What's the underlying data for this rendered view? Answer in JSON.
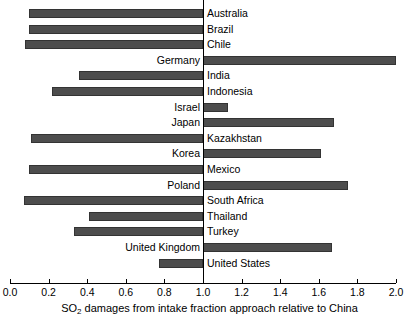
{
  "chart_data": {
    "type": "bar",
    "orientation": "horizontal",
    "title": "",
    "xlabel": "SO2 damages from intake fraction approach relative to China",
    "xlabel_parts": {
      "pre": "SO",
      "sub": "2",
      "post": " damages from intake fraction approach relative to China"
    },
    "ylabel": "",
    "xlim": [
      0.0,
      2.0
    ],
    "reference_value": 1.0,
    "grid": false,
    "legend": null,
    "tick_labels": [
      "0.0",
      "0.2",
      "0.4",
      "0.6",
      "0.8",
      "1.0",
      "1.2",
      "1.4",
      "1.6",
      "1.8",
      "2.0"
    ],
    "ticks": [
      0.0,
      0.2,
      0.4,
      0.6,
      0.8,
      1.0,
      1.2,
      1.4,
      1.6,
      1.8,
      2.0
    ],
    "bar_color": "#4d4d4d",
    "bar_edge_color": "#333333",
    "categories": [
      "Australia",
      "Brazil",
      "Chile",
      "Germany",
      "India",
      "Indonesia",
      "Israel",
      "Japan",
      "Kazakhstan",
      "Korea",
      "Mexico",
      "Poland",
      "South Africa",
      "Thailand",
      "Turkey",
      "United Kingdom",
      "United States"
    ],
    "values": [
      0.1,
      0.1,
      0.08,
      2.0,
      0.36,
      0.22,
      1.13,
      1.68,
      0.11,
      1.61,
      0.1,
      1.75,
      0.07,
      0.41,
      0.33,
      1.67,
      0.77
    ],
    "bars": [
      {
        "label": "Australia",
        "value": 0.1,
        "label_side": "right"
      },
      {
        "label": "Brazil",
        "value": 0.1,
        "label_side": "right"
      },
      {
        "label": "Chile",
        "value": 0.08,
        "label_side": "right"
      },
      {
        "label": "Germany",
        "value": 2.0,
        "label_side": "left"
      },
      {
        "label": "India",
        "value": 0.36,
        "label_side": "right"
      },
      {
        "label": "Indonesia",
        "value": 0.22,
        "label_side": "right"
      },
      {
        "label": "Israel",
        "value": 1.13,
        "label_side": "left"
      },
      {
        "label": "Japan",
        "value": 1.68,
        "label_side": "left"
      },
      {
        "label": "Kazakhstan",
        "value": 0.11,
        "label_side": "right"
      },
      {
        "label": "Korea",
        "value": 1.61,
        "label_side": "left"
      },
      {
        "label": "Mexico",
        "value": 0.1,
        "label_side": "right"
      },
      {
        "label": "Poland",
        "value": 1.75,
        "label_side": "left"
      },
      {
        "label": "South Africa",
        "value": 0.07,
        "label_side": "right"
      },
      {
        "label": "Thailand",
        "value": 0.41,
        "label_side": "right"
      },
      {
        "label": "Turkey",
        "value": 0.33,
        "label_side": "right"
      },
      {
        "label": "United Kingdom",
        "value": 1.67,
        "label_side": "left"
      },
      {
        "label": "United States",
        "value": 0.77,
        "label_side": "right"
      }
    ]
  }
}
